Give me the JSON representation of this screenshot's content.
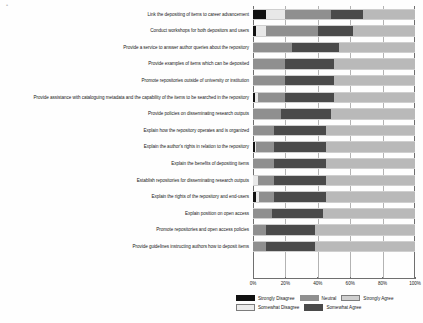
{
  "chart_data": {
    "type": "bar",
    "subtype": "100% stacked horizontal bar (diverging Likert)",
    "title": "",
    "xlabel": "",
    "ylabel": "",
    "xlim": [
      0,
      100
    ],
    "xticks": [
      "0%",
      "20%",
      "40%",
      "60%",
      "80%",
      "100%"
    ],
    "xtick_values": [
      0,
      20,
      40,
      60,
      80,
      100
    ],
    "grid": true,
    "legend_position": "bottom",
    "value_unit": "%",
    "categories": [
      "Link the depositing of items to career advancement",
      "Conduct workshops for both depositors and users",
      "Provide a service to answer author queries about the repository",
      "Provide examples of items which can be deposited",
      "Promote repositories outside of university or institution",
      "Provide assistance with cataloguing metadata and the capability of the items to be searched in the repository",
      "Provide policies on disseminating research outputs",
      "Explain how the repository operates and is organized",
      "Explain the author's rights in relation to the repository",
      "Explain the benefits of depositing items",
      "Establish repositories for disseminating research outputs",
      "Explain the rights of the repository and end-users",
      "Explain position on open access",
      "Promote repositories and open access policies",
      "Provide guidelines instructing authors how to deposit items"
    ],
    "series": [
      {
        "name": "Strongly Disagree",
        "color": "#111111",
        "values": [
          8,
          2,
          0,
          0,
          0,
          1,
          0,
          0,
          1,
          0,
          0,
          2,
          0,
          0,
          0
        ]
      },
      {
        "name": "Somewhat Disagree",
        "color": "#e8e8e8",
        "values": [
          12,
          6,
          0,
          0,
          0,
          2,
          0,
          0,
          1,
          0,
          3,
          2,
          0,
          0,
          0
        ]
      },
      {
        "name": "Neutral",
        "color": "#8f8f8f",
        "values": [
          28,
          32,
          24,
          20,
          20,
          17,
          17,
          13,
          11,
          13,
          10,
          9,
          12,
          8,
          8
        ]
      },
      {
        "name": "Somewhat Agree",
        "color": "#4a4a4a",
        "values": [
          20,
          22,
          29,
          30,
          30,
          30,
          31,
          32,
          32,
          32,
          32,
          32,
          31,
          30,
          30
        ]
      },
      {
        "name": "Strongly Agree",
        "color": "#b9b9b9",
        "values": [
          32,
          38,
          47,
          50,
          50,
          50,
          52,
          55,
          55,
          55,
          55,
          55,
          57,
          62,
          62
        ]
      }
    ],
    "legend": [
      {
        "label": "Strongly Disagree",
        "color": "#111111"
      },
      {
        "label": "Somewhat Disagree",
        "color": "#ececec"
      },
      {
        "label": "Neutral",
        "color": "#8f8f8f"
      },
      {
        "label": "Somewhat Agree",
        "color": "#4a4a4a"
      },
      {
        "label": "Strongly Agree",
        "color": "#cfcfcf"
      }
    ]
  }
}
